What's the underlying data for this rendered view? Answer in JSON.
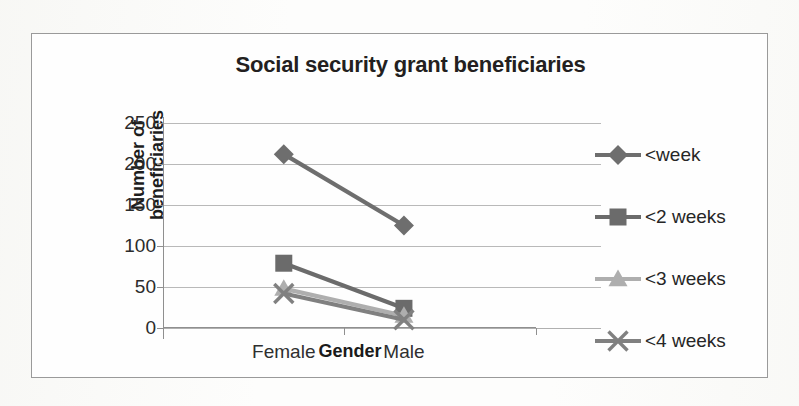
{
  "chart_data": {
    "type": "line",
    "title": "Social security grant beneficiaries",
    "xlabel": "Gender",
    "ylabel": "Number of beneficiaries",
    "categories": [
      "Female",
      "Male"
    ],
    "yticks": [
      250,
      200,
      150,
      100,
      50,
      0
    ],
    "ylim": [
      0,
      250
    ],
    "grid": true,
    "legend_position": "right",
    "series": [
      {
        "name": "<week",
        "values": [
          212,
          125
        ],
        "marker": "diamond",
        "color": "#6e6e6e"
      },
      {
        "name": "<2 weeks",
        "values": [
          79,
          24
        ],
        "marker": "square",
        "color": "#6b6b6b"
      },
      {
        "name": "<3 weeks",
        "values": [
          48,
          15
        ],
        "marker": "triangle",
        "color": "#aeaeae"
      },
      {
        "name": "<4 weeks",
        "values": [
          42,
          10
        ],
        "marker": "cross",
        "color": "#808080"
      }
    ]
  },
  "legend": {
    "items": [
      {
        "label": "<week"
      },
      {
        "label": "<2 weeks"
      },
      {
        "label": "<3 weeks"
      },
      {
        "label": "<4 weeks"
      }
    ]
  },
  "axis": {
    "y_tick_labels": [
      "250",
      "200",
      "150",
      "100",
      "50",
      "0"
    ],
    "x_category_labels": [
      "Female",
      "Male"
    ],
    "x_title": "Gender",
    "y_title_line1": "Number of",
    "y_title_line2": "beneficiaries"
  }
}
